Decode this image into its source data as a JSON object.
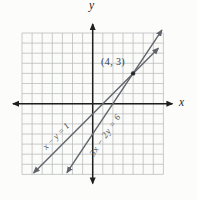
{
  "labels": {
    "x_axis": "x",
    "y_axis": "y",
    "intersection": "(4, 3)",
    "line1": "x − y = 1",
    "line2": "3x − 2y = 6"
  },
  "colors": {
    "axis": "#1f1f1f",
    "grid": "#b4b6b8",
    "line": "#60646a",
    "point": "#2a2d30",
    "grid_fill": "#fbfbf9"
  },
  "chart_data": {
    "type": "line",
    "title": "",
    "xlabel": "x",
    "ylabel": "y",
    "xlim": [
      -7,
      7
    ],
    "ylim": [
      -7,
      7
    ],
    "grid": true,
    "grid_step": 1,
    "legend": "labels drawn along lines",
    "series": [
      {
        "name": "x − y = 1",
        "equation": "x − y = 1",
        "slope": 1,
        "y_intercept": -1,
        "x_intercept": 1,
        "endpoints": [
          [
            -5.85,
            -6.85
          ],
          [
            6.5,
            5.5
          ]
        ],
        "arrows": "both"
      },
      {
        "name": "3x − 2y = 6",
        "equation": "3x − 2y = 6",
        "slope": 1.5,
        "y_intercept": -3,
        "x_intercept": 2,
        "endpoints": [
          [
            -2.55,
            -6.83
          ],
          [
            6.85,
            7.28
          ]
        ],
        "arrows": "both"
      }
    ],
    "intersection_point": {
      "x": 4,
      "y": 3,
      "label": "(4, 3)"
    }
  }
}
